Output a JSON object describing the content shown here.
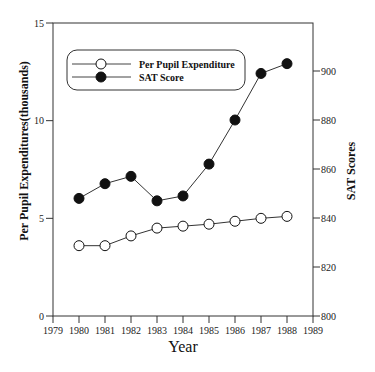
{
  "chart_data": {
    "type": "line",
    "title": "",
    "xlabel": "Year",
    "ylabel": "Per Pupil Expenditures(thousands)",
    "y2label": "SAT Scores",
    "x": [
      1980,
      1981,
      1982,
      1983,
      1984,
      1985,
      1986,
      1987,
      1988
    ],
    "xlim": [
      1979,
      1989
    ],
    "xticks": [
      "1979",
      "1980",
      "1981",
      "1982",
      "1983",
      "1984",
      "1985",
      "1986",
      "1987",
      "1988",
      "1989"
    ],
    "ylim": [
      0,
      15
    ],
    "yticks": [
      "0",
      "5",
      "10",
      "15"
    ],
    "y2lim": [
      800,
      920
    ],
    "y2ticks": [
      "800",
      "820",
      "840",
      "860",
      "880",
      "900"
    ],
    "grid": false,
    "legend_position": "upper left (inside, rounded box)",
    "series": [
      {
        "name": "Per Pupil Expenditure",
        "axis": "left",
        "marker": "open-circle",
        "values": [
          3.6,
          3.6,
          4.1,
          4.5,
          4.6,
          4.7,
          4.85,
          5.0,
          5.1
        ]
      },
      {
        "name": "SAT Score",
        "axis": "right",
        "marker": "filled-circle",
        "values": [
          848,
          854,
          857,
          847,
          849,
          862,
          880,
          899,
          903
        ]
      }
    ]
  },
  "labels": {
    "x_title": "Year",
    "y_title": "Per Pupil Expenditures(thousands)",
    "y2_title": "SAT Scores",
    "legend": [
      "Per Pupil Expenditure",
      "SAT Score"
    ]
  }
}
